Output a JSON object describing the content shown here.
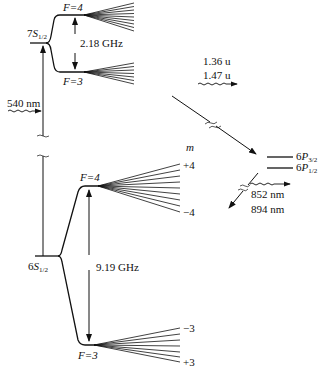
{
  "diagram": {
    "type": "energy-level diagram"
  },
  "levels": {
    "s7": {
      "prefix": "7",
      "letter": "S",
      "sub": "1/2",
      "F_upper": "F=4",
      "F_lower": "F=3",
      "splitting": "2.18 GHz"
    },
    "s6": {
      "prefix": "6",
      "letter": "S",
      "sub": "1/2",
      "F_upper": "F=4",
      "F_lower": "F=3",
      "splitting": "9.19 GHz"
    },
    "p32": {
      "prefix": "6",
      "letter": "P",
      "sub": "3/2"
    },
    "p12": {
      "prefix": "6",
      "letter": "P",
      "sub": "1/2"
    }
  },
  "transitions": {
    "excite": "540 nm",
    "decay1_a": "1.36 u",
    "decay1_b": "1.47 u",
    "decay2_a": "852 nm",
    "decay2_b": "894 nm"
  },
  "m_labels": {
    "header": "m",
    "f4_top": "+4",
    "f4_bottom": "−4",
    "f3_top": "−3",
    "f3_bottom": "+3"
  }
}
